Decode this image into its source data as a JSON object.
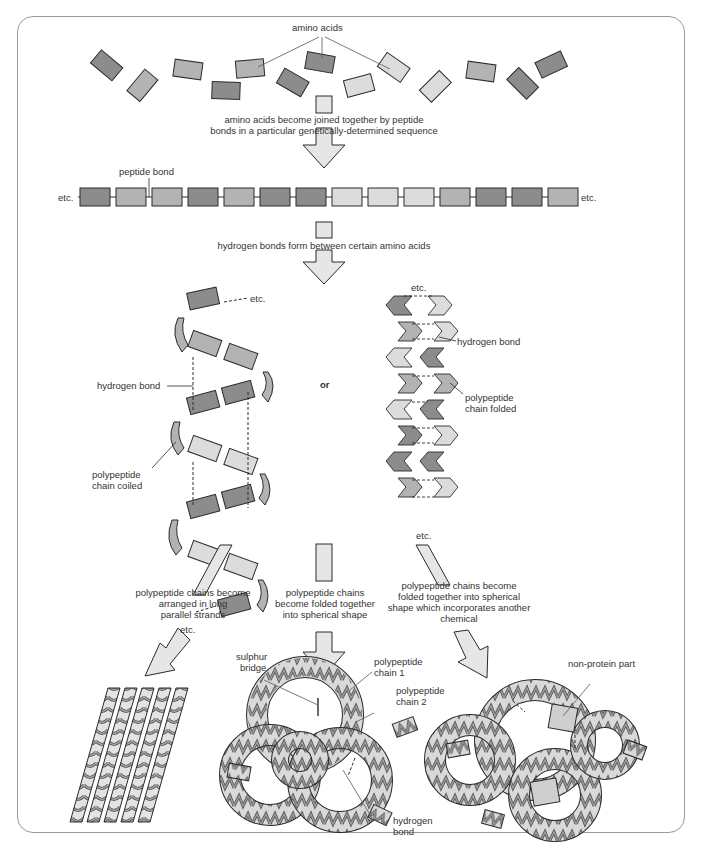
{
  "figure": {
    "colors": {
      "dark": "#8c8c8c",
      "mid": "#b3b3b3",
      "light": "#dcdcdc",
      "outline": "#2a2a2a",
      "frame": "#9a9a9a",
      "arrow_fill": "#e6e6e6"
    }
  },
  "labels": {
    "amino_acids": "amino acids",
    "step1_line1": "amino acids become joined together by peptide",
    "step1_line2": "bonds in a particular genetically-determined sequence",
    "peptide_bond": "peptide bond",
    "etc_left": "etc.",
    "etc_right": "etc.",
    "step2": "hydrogen bonds form between certain amino acids",
    "helix": {
      "etc_top": "etc.",
      "etc_bottom": "etc.",
      "hydrogen_bond": "hydrogen bond",
      "coiled_line1": "polypeptide",
      "coiled_line2": "chain coiled"
    },
    "or": "or",
    "sheet": {
      "etc_top": "etc.",
      "etc_bottom": "etc.",
      "hydrogen_bond": "hydrogen bond",
      "folded_line1": "polypeptide",
      "folded_line2": "chain folded"
    },
    "branch_left": {
      "line1": "polypeptide chains become",
      "line2": "arranged in long",
      "line3": "parallel strands"
    },
    "branch_middle": {
      "line1": "polypeptide chains",
      "line2": "become folded together",
      "line3": "into spherical shape"
    },
    "branch_right": {
      "line1": "polypeptide chains become",
      "line2": "folded together into spherical",
      "line3": "shape which incorporates another",
      "line4": "chemical"
    },
    "globular": {
      "sulphur_line1": "sulphur",
      "sulphur_line2": "bridge",
      "chain1_line1": "polypeptide",
      "chain1_line2": "chain 1",
      "chain2_line1": "polypeptide",
      "chain2_line2": "chain 2",
      "hbond_line1": "hydrogen",
      "hbond_line2": "bond"
    },
    "conjugated": {
      "non_protein": "non-protein part"
    }
  },
  "amino_acid_chain_shades": [
    "dark",
    "mid",
    "mid",
    "dark",
    "mid",
    "dark",
    "dark",
    "light",
    "light",
    "light",
    "mid",
    "dark",
    "dark",
    "mid"
  ]
}
